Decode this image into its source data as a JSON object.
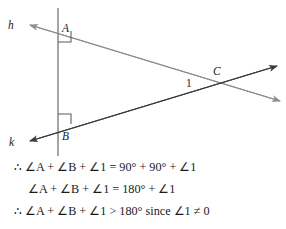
{
  "figure": {
    "background_color": "#ffffff",
    "line_color_dark": "#3a3a3a",
    "line_color_light": "#8c8c8c",
    "labels": {
      "h": "h",
      "k": "k",
      "A": "A",
      "B": "B",
      "C": "C",
      "angle_one": "1"
    },
    "points": {
      "A": {
        "x": 58,
        "y": 30
      },
      "B": {
        "x": 58,
        "y": 128
      },
      "C": {
        "x": 219,
        "y": 80
      }
    },
    "vertical_line": {
      "x": 58,
      "y_top": 8,
      "y_bottom": 156
    },
    "right_angle_markers": [
      {
        "at": "A",
        "size": 13
      },
      {
        "at": "B",
        "size": 13
      }
    ],
    "rays": [
      {
        "name": "ray-h",
        "from": "A",
        "to_label": "h",
        "arrow": "left",
        "color": "light"
      },
      {
        "name": "ray-k",
        "from": "B",
        "to_label": "k",
        "arrow": "left",
        "color": "dark"
      },
      {
        "name": "ray-A-through-C",
        "from": "A",
        "through": "C",
        "arrow": "right",
        "color": "light"
      },
      {
        "name": "ray-B-through-C",
        "from": "B",
        "through": "C",
        "arrow": "right",
        "color": "dark"
      }
    ]
  },
  "proof": {
    "lines": [
      "∴ ∠A + ∠B + ∠1 = 90° + 90° + ∠1",
      "∠A + ∠B + ∠1 = 180° + ∠1",
      "∴ ∠A + ∠B + ∠1 > 180° since ∠1 ≠ 0"
    ]
  }
}
